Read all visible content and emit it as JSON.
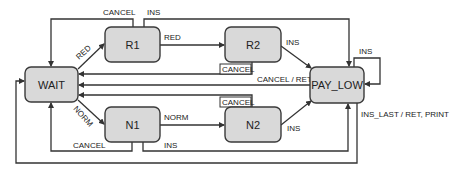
{
  "diagram": {
    "type": "state-machine",
    "nodes": {
      "wait": "WAIT",
      "r1": "R1",
      "r2": "R2",
      "n1": "N1",
      "n2": "N2",
      "pay_low": "PAY_LOW"
    },
    "edges": {
      "wait_r1": "RED",
      "r1_r2": "RED",
      "wait_n1": "NORM",
      "n1_n2": "NORM",
      "r1_cancel": "CANCEL",
      "r1_ins": "INS",
      "r2_ins": "INS",
      "r2_cancel": "CANCEL",
      "pay_low_cancel": "CANCEL / RET",
      "n2_cancel": "CANCEL",
      "n2_ins": "INS",
      "n1_cancel": "CANCEL",
      "n1_ins": "INS",
      "pay_low_self": "INS",
      "pay_low_last": "INS_LAST / RET, PRINT"
    }
  }
}
